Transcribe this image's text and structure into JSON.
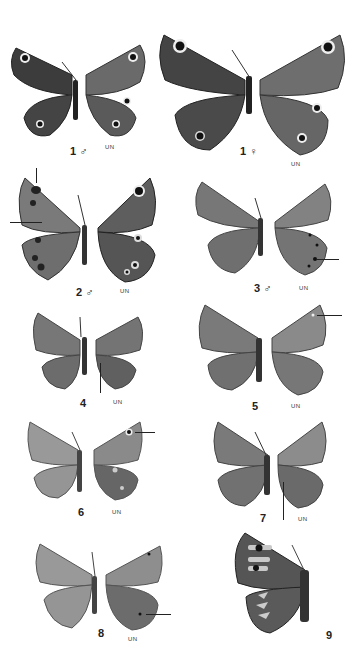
{
  "plate": {
    "background": "#ffffff",
    "specimens": [
      {
        "id": "1m",
        "label": "1 ♂",
        "underside_label": "UN"
      },
      {
        "id": "1f",
        "label": "1 ♀",
        "underside_label": "UN"
      },
      {
        "id": "2m",
        "label": "2 ♂",
        "underside_label": "UN"
      },
      {
        "id": "3m",
        "label": "3 ♂",
        "underside_label": "UN"
      },
      {
        "id": "4",
        "label": "4",
        "underside_label": "UN"
      },
      {
        "id": "5",
        "label": "5",
        "underside_label": "UN"
      },
      {
        "id": "6",
        "label": "6",
        "underside_label": "UN"
      },
      {
        "id": "7",
        "label": "7",
        "underside_label": "UN"
      },
      {
        "id": "8",
        "label": "8",
        "underside_label": "UN"
      },
      {
        "id": "9",
        "label": "9"
      }
    ]
  }
}
